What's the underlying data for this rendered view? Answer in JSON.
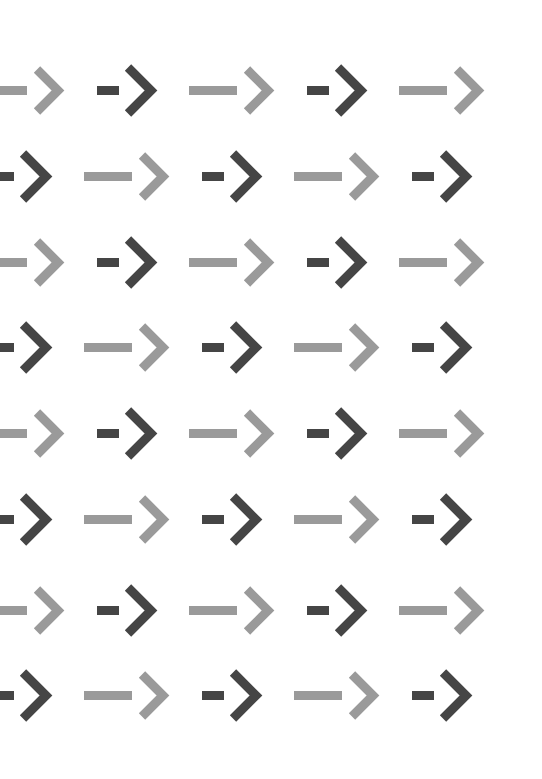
{
  "canvas": {
    "width": 542,
    "height": 779,
    "background_color": "#ffffff",
    "description": "Repeating tiled pattern of right-pointing arrows in two shades of gray"
  },
  "palette": {
    "dark": "#454545",
    "light": "#9a9a9a",
    "background": "#ffffff"
  },
  "grid": {
    "rows": 8,
    "visible_columns": 5,
    "column_spacing": 105,
    "row_spacing": 86,
    "column_centers": [
      23,
      128,
      233,
      338,
      443
    ],
    "row_centers": [
      90,
      176,
      262,
      347,
      433,
      519,
      610,
      695
    ],
    "clipped_left_edge": true,
    "clipped_right_edge": true
  },
  "arrow_styles": {
    "dark": {
      "name": "short-shaft-dark-arrow",
      "color": "#454545",
      "shaft_length": 22,
      "shaft_thickness": 9,
      "chevron_half_height": 23,
      "chevron_width": 23,
      "stroke_width": 9,
      "gap": 9
    },
    "light": {
      "name": "long-shaft-light-arrow",
      "color": "#9a9a9a",
      "shaft_length": 48,
      "shaft_thickness": 9,
      "chevron_half_height": 21,
      "chevron_width": 21,
      "stroke_width": 9,
      "gap": 10
    }
  },
  "arrows": [
    {
      "row": 0,
      "col": 0,
      "cx": 23,
      "cy": 90,
      "tone": "light"
    },
    {
      "row": 0,
      "col": 1,
      "cx": 128,
      "cy": 90,
      "tone": "dark"
    },
    {
      "row": 0,
      "col": 2,
      "cx": 233,
      "cy": 90,
      "tone": "light"
    },
    {
      "row": 0,
      "col": 3,
      "cx": 338,
      "cy": 90,
      "tone": "dark"
    },
    {
      "row": 0,
      "col": 4,
      "cx": 443,
      "cy": 90,
      "tone": "light"
    },
    {
      "row": 1,
      "col": 0,
      "cx": 23,
      "cy": 176,
      "tone": "dark"
    },
    {
      "row": 1,
      "col": 1,
      "cx": 128,
      "cy": 176,
      "tone": "light"
    },
    {
      "row": 1,
      "col": 2,
      "cx": 233,
      "cy": 176,
      "tone": "dark"
    },
    {
      "row": 1,
      "col": 3,
      "cx": 338,
      "cy": 176,
      "tone": "light"
    },
    {
      "row": 1,
      "col": 4,
      "cx": 443,
      "cy": 176,
      "tone": "dark"
    },
    {
      "row": 2,
      "col": 0,
      "cx": 23,
      "cy": 262,
      "tone": "light"
    },
    {
      "row": 2,
      "col": 1,
      "cx": 128,
      "cy": 262,
      "tone": "dark"
    },
    {
      "row": 2,
      "col": 2,
      "cx": 233,
      "cy": 262,
      "tone": "light"
    },
    {
      "row": 2,
      "col": 3,
      "cx": 338,
      "cy": 262,
      "tone": "dark"
    },
    {
      "row": 2,
      "col": 4,
      "cx": 443,
      "cy": 262,
      "tone": "light"
    },
    {
      "row": 3,
      "col": 0,
      "cx": 23,
      "cy": 347,
      "tone": "dark"
    },
    {
      "row": 3,
      "col": 1,
      "cx": 128,
      "cy": 347,
      "tone": "light"
    },
    {
      "row": 3,
      "col": 2,
      "cx": 233,
      "cy": 347,
      "tone": "dark"
    },
    {
      "row": 3,
      "col": 3,
      "cx": 338,
      "cy": 347,
      "tone": "light"
    },
    {
      "row": 3,
      "col": 4,
      "cx": 443,
      "cy": 347,
      "tone": "dark"
    },
    {
      "row": 4,
      "col": 0,
      "cx": 23,
      "cy": 433,
      "tone": "light"
    },
    {
      "row": 4,
      "col": 1,
      "cx": 128,
      "cy": 433,
      "tone": "dark"
    },
    {
      "row": 4,
      "col": 2,
      "cx": 233,
      "cy": 433,
      "tone": "light"
    },
    {
      "row": 4,
      "col": 3,
      "cx": 338,
      "cy": 433,
      "tone": "dark"
    },
    {
      "row": 4,
      "col": 4,
      "cx": 443,
      "cy": 433,
      "tone": "light"
    },
    {
      "row": 5,
      "col": 0,
      "cx": 23,
      "cy": 519,
      "tone": "dark"
    },
    {
      "row": 5,
      "col": 1,
      "cx": 128,
      "cy": 519,
      "tone": "light"
    },
    {
      "row": 5,
      "col": 2,
      "cx": 233,
      "cy": 519,
      "tone": "dark"
    },
    {
      "row": 5,
      "col": 3,
      "cx": 338,
      "cy": 519,
      "tone": "light"
    },
    {
      "row": 5,
      "col": 4,
      "cx": 443,
      "cy": 519,
      "tone": "dark"
    },
    {
      "row": 6,
      "col": 0,
      "cx": 23,
      "cy": 610,
      "tone": "light"
    },
    {
      "row": 6,
      "col": 1,
      "cx": 128,
      "cy": 610,
      "tone": "dark"
    },
    {
      "row": 6,
      "col": 2,
      "cx": 233,
      "cy": 610,
      "tone": "light"
    },
    {
      "row": 6,
      "col": 3,
      "cx": 338,
      "cy": 610,
      "tone": "dark"
    },
    {
      "row": 6,
      "col": 4,
      "cx": 443,
      "cy": 610,
      "tone": "light"
    },
    {
      "row": 7,
      "col": 0,
      "cx": 23,
      "cy": 695,
      "tone": "dark"
    },
    {
      "row": 7,
      "col": 1,
      "cx": 128,
      "cy": 695,
      "tone": "light"
    },
    {
      "row": 7,
      "col": 2,
      "cx": 233,
      "cy": 695,
      "tone": "dark"
    },
    {
      "row": 7,
      "col": 3,
      "cx": 338,
      "cy": 695,
      "tone": "light"
    },
    {
      "row": 7,
      "col": 4,
      "cx": 443,
      "cy": 695,
      "tone": "dark"
    }
  ]
}
